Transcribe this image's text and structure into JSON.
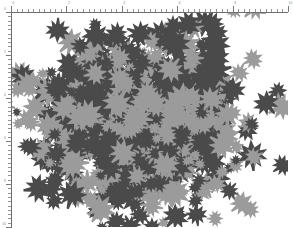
{
  "figure": {
    "background": "#ffffff",
    "width": 293,
    "height": 228,
    "title": "",
    "subtitle": ""
  },
  "axes": {
    "color": "#6e6e6e",
    "tick_color": "#7a7a7a",
    "minor_tick_color": "#949494",
    "label_color": "#8a8a8a",
    "x_axis": {
      "position": "top",
      "label": "",
      "range": [
        0,
        10
      ],
      "major_ticks": [
        0,
        2,
        4,
        6,
        8,
        10
      ],
      "major_tick_labels": [
        "0",
        "2",
        "4",
        "6",
        "8",
        "10"
      ],
      "minor_tick_count_between": 9
    },
    "y_axis": {
      "position": "left",
      "label": "",
      "range": [
        0,
        10
      ],
      "major_ticks": [
        0,
        2,
        4,
        6,
        8,
        10
      ],
      "major_tick_labels": [
        "0",
        "2",
        "4",
        "6",
        "8",
        "10"
      ],
      "minor_tick_count_between": 9
    }
  },
  "chart_data": {
    "type": "scatter",
    "title": "",
    "xlabel": "",
    "ylabel": "",
    "xlim": [
      0,
      10
    ],
    "ylim": [
      0,
      10
    ],
    "grid": false,
    "legend": "none",
    "marker": "maple-leaf-glyph",
    "marker_sizes": [
      5,
      16
    ],
    "series": [
      {
        "name": "dark",
        "color": "#4a4a4a",
        "point_count": 520
      },
      {
        "name": "light",
        "color": "#9b9b9b",
        "point_count": 360
      }
    ],
    "distribution": "gaussian-cluster",
    "cluster_center": [
      4.6,
      5.1
    ],
    "cluster_spread": [
      2.3,
      2.3
    ]
  }
}
